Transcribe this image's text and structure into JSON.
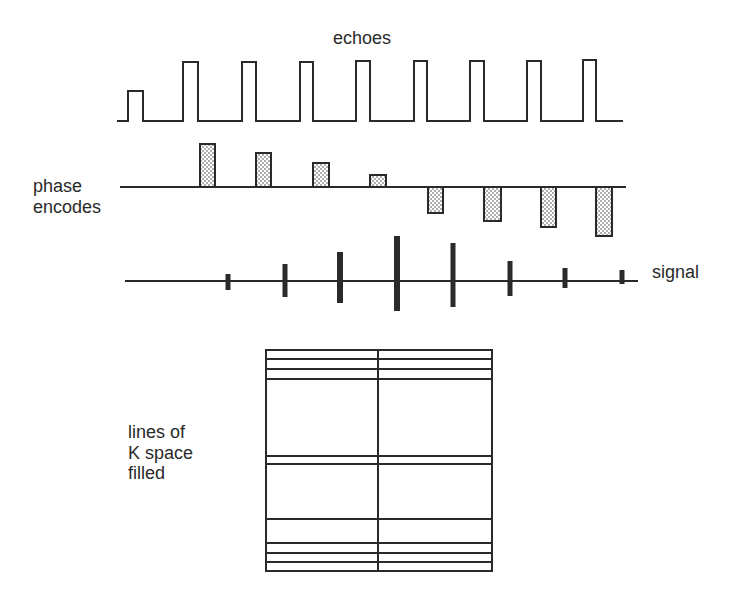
{
  "labels": {
    "echoes": "echoes",
    "phase_line1": "phase",
    "phase_line2": "encodes",
    "signal": "signal",
    "kspace_line1": "lines of",
    "kspace_line2": "K space",
    "kspace_line3": "filled"
  },
  "colors": {
    "ink": "#2a2a2a",
    "stipple": "#8a8a8a",
    "background": "#ffffff"
  },
  "echoes": {
    "baseline_y": 121,
    "x_start": 117,
    "x_end": 623,
    "pulses": [
      {
        "x0": 128,
        "x1": 143,
        "top": 91
      },
      {
        "x0": 183,
        "x1": 198,
        "top": 62
      },
      {
        "x0": 242,
        "x1": 256,
        "top": 62
      },
      {
        "x0": 300,
        "x1": 313,
        "top": 62
      },
      {
        "x0": 356,
        "x1": 370,
        "top": 61
      },
      {
        "x0": 414,
        "x1": 427,
        "top": 61
      },
      {
        "x0": 470,
        "x1": 484,
        "top": 61
      },
      {
        "x0": 527,
        "x1": 541,
        "top": 61
      },
      {
        "x0": 583,
        "x1": 596,
        "top": 60
      }
    ]
  },
  "phase_encodes": {
    "baseline_y": 187,
    "x_start": 120,
    "x_end": 626,
    "bars": [
      {
        "x0": 200,
        "x1": 215,
        "end_y": 144
      },
      {
        "x0": 256,
        "x1": 271,
        "end_y": 153
      },
      {
        "x0": 313,
        "x1": 329,
        "end_y": 163
      },
      {
        "x0": 370,
        "x1": 386,
        "end_y": 175
      },
      {
        "x0": 428,
        "x1": 443,
        "end_y": 213
      },
      {
        "x0": 484,
        "x1": 501,
        "end_y": 221
      },
      {
        "x0": 541,
        "x1": 556,
        "end_y": 227
      },
      {
        "x0": 596,
        "x1": 612,
        "end_y": 236
      }
    ]
  },
  "signal": {
    "baseline_y": 281,
    "x_start": 125,
    "x_end": 638,
    "spikes": [
      {
        "x": 228,
        "y0": 274,
        "y1": 290,
        "w": 5
      },
      {
        "x": 285,
        "y0": 264,
        "y1": 297,
        "w": 5
      },
      {
        "x": 340,
        "y0": 252,
        "y1": 303,
        "w": 6
      },
      {
        "x": 397,
        "y0": 236,
        "y1": 311,
        "w": 6
      },
      {
        "x": 453,
        "y0": 243,
        "y1": 307,
        "w": 5
      },
      {
        "x": 510,
        "y0": 261,
        "y1": 296,
        "w": 5
      },
      {
        "x": 565,
        "y0": 268,
        "y1": 288,
        "w": 5
      },
      {
        "x": 622,
        "y0": 270,
        "y1": 284,
        "w": 5
      }
    ]
  },
  "kspace": {
    "x0": 266,
    "x1": 492,
    "y0": 350,
    "y1": 571,
    "center_x": 378,
    "lines_y": [
      359,
      369,
      379,
      456,
      464,
      519,
      543,
      553,
      562
    ]
  }
}
